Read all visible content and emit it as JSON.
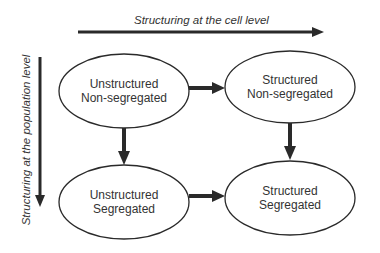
{
  "axes": {
    "horizontal_label": "Structuring at the cell level",
    "vertical_label": "Structuring at the population level"
  },
  "nodes": [
    {
      "id": "tl",
      "line1": "Unstructured",
      "line2": "Non-segregated"
    },
    {
      "id": "tr",
      "line1": "Structured",
      "line2": "Non-segregated"
    },
    {
      "id": "bl",
      "line1": "Unstructured",
      "line2": "Segregated"
    },
    {
      "id": "br",
      "line1": "Structured",
      "line2": "Segregated"
    }
  ],
  "edges": [
    {
      "from": "tl",
      "to": "tr"
    },
    {
      "from": "tl",
      "to": "bl"
    },
    {
      "from": "tr",
      "to": "br"
    },
    {
      "from": "bl",
      "to": "br"
    }
  ],
  "colors": {
    "stroke": "#2a2a2a",
    "background": "#ffffff"
  }
}
